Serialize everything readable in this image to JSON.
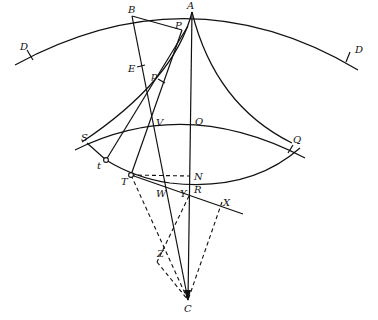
{
  "diagram": {
    "colors": {
      "ink": "#111111",
      "background": "#ffffff"
    },
    "labels": {
      "A": "A",
      "B": "B",
      "P": "P",
      "D_left": "D",
      "D_right": "D",
      "E": "E",
      "p": "p",
      "V": "V",
      "O": "O",
      "Q": "Q",
      "S": "S",
      "t": "t",
      "T": "T",
      "N": "N",
      "W": "W",
      "Y": "Y",
      "R": "R",
      "X": "X",
      "Z": "Z",
      "C": "C"
    }
  }
}
